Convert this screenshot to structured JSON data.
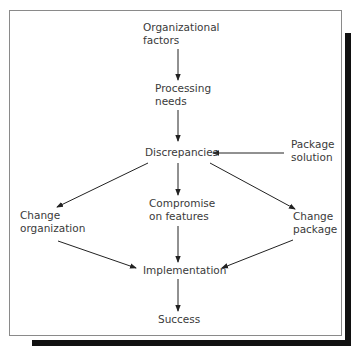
{
  "diagram": {
    "nodes": {
      "organizational_factors": {
        "line1": "Organizational",
        "line2": "factors"
      },
      "processing_needs": {
        "line1": "Processing",
        "line2": "needs"
      },
      "discrepancies": {
        "line1": "Discrepancies"
      },
      "package_solution": {
        "line1": "Package",
        "line2": "solution"
      },
      "change_organization": {
        "line1": "Change",
        "line2": "organization"
      },
      "compromise_features": {
        "line1": "Compromise",
        "line2": "on features"
      },
      "change_package": {
        "line1": "Change",
        "line2": "package"
      },
      "implementation": {
        "line1": "Implementation"
      },
      "success": {
        "line1": "Success"
      }
    },
    "edges": [
      {
        "from": "Organizational factors",
        "to": "Processing needs"
      },
      {
        "from": "Processing needs",
        "to": "Discrepancies"
      },
      {
        "from": "Package solution",
        "to": "Discrepancies"
      },
      {
        "from": "Discrepancies",
        "to": "Change organization"
      },
      {
        "from": "Discrepancies",
        "to": "Compromise on features"
      },
      {
        "from": "Discrepancies",
        "to": "Change package"
      },
      {
        "from": "Change organization",
        "to": "Implementation"
      },
      {
        "from": "Compromise on features",
        "to": "Implementation"
      },
      {
        "from": "Change package",
        "to": "Implementation"
      },
      {
        "from": "Implementation",
        "to": "Success"
      }
    ],
    "colors": {
      "text": "#3a3a3a",
      "line": "#222222",
      "shadow": "#111111",
      "border": "#8a8a8a"
    }
  }
}
